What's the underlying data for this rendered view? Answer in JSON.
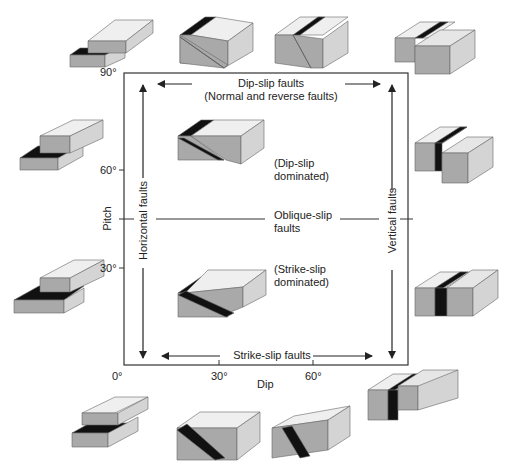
{
  "colors": {
    "frame": "#333333",
    "text": "#222222",
    "top_face": "#efefef",
    "front_face": "#a9a9a9",
    "side_face": "#d4d4d4",
    "fault_plane": "#111111",
    "background": "#ffffff"
  },
  "axes": {
    "x_label": "Dip",
    "y_label": "Pitch",
    "x_ticks": [
      "0°",
      "30°",
      "60°"
    ],
    "y_ticks": [
      "90°",
      "60°",
      "30°"
    ]
  },
  "labels": {
    "top": "Dip-slip faults",
    "top_sub": "(Normal and reverse faults)",
    "bottom": "Strike-slip faults",
    "left": "Horizontal faults",
    "right": "Vertical faults",
    "middle": "Oblique-slip",
    "middle_sub": "faults",
    "upper_region": "(Dip-slip",
    "upper_region_sub": "dominated)",
    "lower_region": "(Strike-slip",
    "lower_region_sub": "dominated)"
  },
  "blocks": [
    {
      "name": "block-top-horizontal-dipslip",
      "x": 70,
      "y": 15
    },
    {
      "name": "block-top-30-dipslip",
      "x": 180,
      "y": 15
    },
    {
      "name": "block-top-60-dipslip",
      "x": 275,
      "y": 15
    },
    {
      "name": "block-top-vertical-dipslip",
      "x": 395,
      "y": 18
    },
    {
      "name": "block-left-60-horizontal",
      "x": 18,
      "y": 118
    },
    {
      "name": "block-left-30-horizontal",
      "x": 14,
      "y": 258
    },
    {
      "name": "block-right-60-vertical",
      "x": 415,
      "y": 125
    },
    {
      "name": "block-right-30-vertical",
      "x": 415,
      "y": 270
    },
    {
      "name": "block-center-dipslip-dominated",
      "x": 176,
      "y": 108
    },
    {
      "name": "block-center-strikeslip-dominated",
      "x": 176,
      "y": 265
    },
    {
      "name": "block-bottom-horizontal-strikeslip",
      "x": 70,
      "y": 395
    },
    {
      "name": "block-bottom-30-strikeslip",
      "x": 175,
      "y": 400
    },
    {
      "name": "block-bottom-60-strikeslip",
      "x": 272,
      "y": 402
    },
    {
      "name": "block-bottom-vertical-strikeslip",
      "x": 368,
      "y": 374
    }
  ]
}
